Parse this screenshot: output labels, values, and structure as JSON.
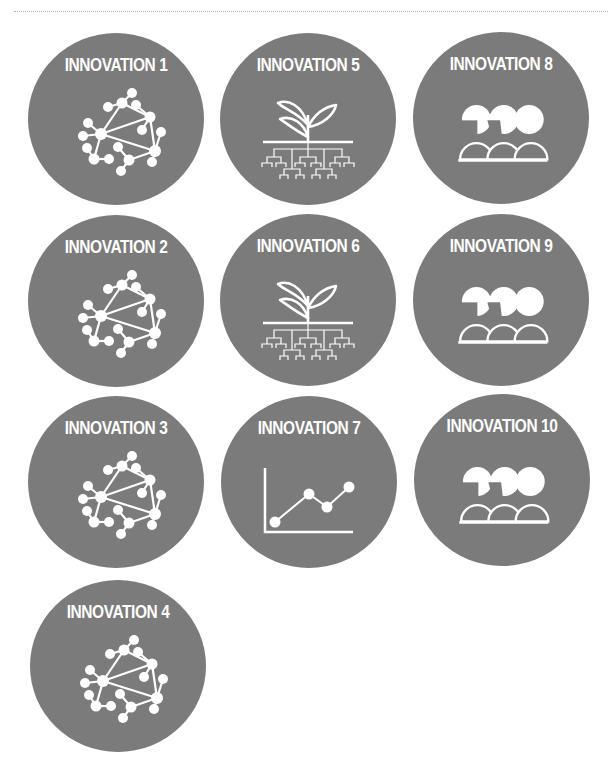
{
  "page": {
    "heading": "Innovations",
    "colors": {
      "badge_bg": "#7b7b7b",
      "icon": "#ffffff",
      "rule": "#b5b5b5"
    }
  },
  "badges": [
    {
      "id": 1,
      "label": "INNOVATION 1",
      "icon": "network-icon"
    },
    {
      "id": 2,
      "label": "INNOVATION 2",
      "icon": "network-icon"
    },
    {
      "id": 3,
      "label": "INNOVATION 3",
      "icon": "network-icon"
    },
    {
      "id": 4,
      "label": "INNOVATION 4",
      "icon": "network-icon"
    },
    {
      "id": 5,
      "label": "INNOVATION 5",
      "icon": "plant-roots-icon"
    },
    {
      "id": 6,
      "label": "INNOVATION 6",
      "icon": "plant-roots-icon"
    },
    {
      "id": 7,
      "label": "INNOVATION 7",
      "icon": "line-chart-icon"
    },
    {
      "id": 8,
      "label": "INNOVATION 8",
      "icon": "people-group-icon"
    },
    {
      "id": 9,
      "label": "INNOVATION 9",
      "icon": "people-group-icon"
    },
    {
      "id": 10,
      "label": "INNOVATION 10",
      "icon": "people-group-icon"
    }
  ]
}
